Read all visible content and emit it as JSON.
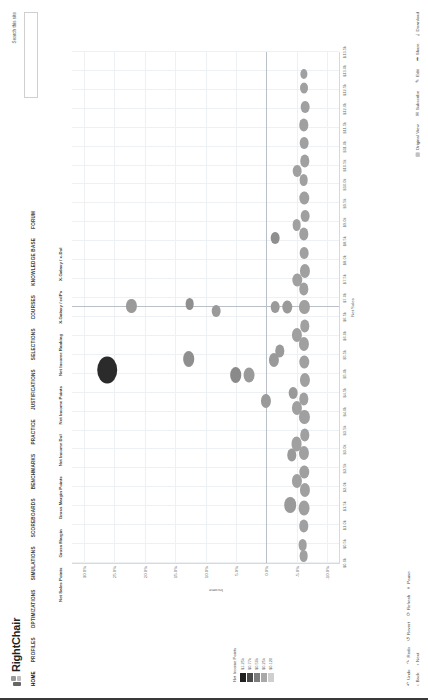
{
  "brand": {
    "name": "RightChair",
    "tagline": ""
  },
  "nav": {
    "items": [
      {
        "label": "HOME",
        "active": true
      },
      {
        "label": "PROFILES",
        "active": false
      },
      {
        "label": "OPTIMIZATIONS",
        "active": false
      },
      {
        "label": "SIMULATIONS",
        "active": false
      },
      {
        "label": "SCOREBOARDS",
        "active": false
      },
      {
        "label": "BENCHMARKS",
        "active": false
      },
      {
        "label": "PRACTICE",
        "active": false
      },
      {
        "label": "JUSTIFICATIONS",
        "active": false
      },
      {
        "label": "SELECTIONS",
        "active": false
      },
      {
        "label": "COURSES",
        "active": false
      },
      {
        "label": "KNOWLEDGE BASE",
        "active": false
      },
      {
        "label": "FORUM",
        "active": false
      }
    ]
  },
  "search": {
    "label": "Search this site",
    "value": "",
    "placeholder": ""
  },
  "columns": [
    "Net Sales Points",
    "Gross Margin",
    "Gross Margin Points",
    "Net Income Dol",
    "Net Income Points",
    "Net Income Ranking",
    "X-Galaxy / edPs",
    "X-Galaxy / x-Dol"
  ],
  "legend": {
    "title": "Net Income Points",
    "stops": [
      {
        "color": "#1f1f1f",
        "value": "$1.25k"
      },
      {
        "color": "#4a4a4a",
        "value": "$0.77k"
      },
      {
        "color": "#7d7d7d",
        "value": "$0.50k"
      },
      {
        "color": "#a8a8a8",
        "value": "$0.25k"
      },
      {
        "color": "#cfcfcf",
        "value": "$0.120"
      }
    ]
  },
  "toolbar_left": [
    {
      "icon": "arrow-left",
      "label": "Back"
    },
    {
      "icon": "arrow-right",
      "label": "Next"
    }
  ],
  "toolbar_left_top": [
    {
      "icon": "undo",
      "label": "Undo"
    },
    {
      "icon": "redo",
      "label": "Redo"
    },
    {
      "icon": "revert",
      "label": "Revert"
    },
    {
      "icon": "refresh",
      "label": "Refresh"
    },
    {
      "icon": "pause",
      "label": "Pause"
    }
  ],
  "toolbar_right": [
    {
      "icon": "layout",
      "label": "Original View"
    },
    {
      "icon": "subscribe",
      "label": "Subscribe"
    },
    {
      "icon": "edit",
      "label": "Edit"
    },
    {
      "icon": "share",
      "label": "Share"
    },
    {
      "icon": "download",
      "label": "Download"
    }
  ],
  "chart_data": {
    "type": "scatter",
    "title": "",
    "xlabel": "Net Sales",
    "ylabel": "Income",
    "xlim": [
      0,
      28
    ],
    "ylim": [
      -0.12,
      0.32
    ],
    "grid": true,
    "legend_position": "left-bottom",
    "xticks": [
      "$0.0k",
      "$0.5k",
      "$1.0k",
      "$1.5k",
      "$2.0k",
      "$2.5k",
      "$3.0k",
      "$3.5k",
      "$4.0k",
      "$4.5k",
      "$5.0k",
      "$5.5k",
      "$6.0k",
      "$6.5k",
      "$7.0k",
      "$7.5k",
      "$8.0k",
      "$8.5k",
      "$9.0k",
      "$9.5k",
      "$10.0k",
      "$10.5k",
      "$11.0k",
      "$11.5k",
      "$12.0k",
      "$12.5k",
      "$13.0k",
      "$13.5k"
    ],
    "yticks": [
      "-10.0%",
      "-5.0%",
      "0.0%",
      "5.0%",
      "10.0%",
      "15.0%",
      "20.0%",
      "25.0%",
      "30.0%"
    ],
    "points": [
      {
        "x": 10.6,
        "y": 0.262,
        "r": 13.5,
        "color": "#2b2b2b"
      },
      {
        "x": 14.1,
        "y": 0.222,
        "r": 7.0,
        "color": "#9a9a9a"
      },
      {
        "x": 11.2,
        "y": 0.128,
        "r": 8.0,
        "color": "#8f8f8f"
      },
      {
        "x": 14.2,
        "y": 0.126,
        "r": 6.0,
        "color": "#8f8f8f"
      },
      {
        "x": 13.8,
        "y": 0.082,
        "r": 6.0,
        "color": "#9a9a9a"
      },
      {
        "x": 10.3,
        "y": 0.05,
        "r": 8.0,
        "color": "#8a8a8a"
      },
      {
        "x": 10.3,
        "y": 0.028,
        "r": 7.5,
        "color": "#9a9a9a"
      },
      {
        "x": 8.9,
        "y": 0.0,
        "r": 7.0,
        "color": "#9a9a9a"
      },
      {
        "x": 11.1,
        "y": -0.013,
        "r": 7.0,
        "color": "#9a9a9a"
      },
      {
        "x": 14.0,
        "y": -0.015,
        "r": 6.0,
        "color": "#9a9a9a"
      },
      {
        "x": 14.0,
        "y": -0.035,
        "r": 6.5,
        "color": "#9a9a9a"
      },
      {
        "x": 17.8,
        "y": -0.015,
        "r": 6.0,
        "color": "#8f8f8f"
      },
      {
        "x": 11.6,
        "y": -0.022,
        "r": 6.5,
        "color": "#9a9a9a"
      },
      {
        "x": 3.2,
        "y": -0.04,
        "r": 8.0,
        "color": "#9a9a9a"
      },
      {
        "x": 5.9,
        "y": -0.042,
        "r": 6.5,
        "color": "#9a9a9a"
      },
      {
        "x": 9.3,
        "y": -0.045,
        "r": 6.0,
        "color": "#9a9a9a"
      },
      {
        "x": 1.0,
        "y": -0.06,
        "r": 6.0,
        "color": "#a0a0a0"
      },
      {
        "x": 2.0,
        "y": -0.062,
        "r": 6.5,
        "color": "#a0a0a0"
      },
      {
        "x": 3.0,
        "y": -0.063,
        "r": 7.5,
        "color": "#a0a0a0"
      },
      {
        "x": 4.0,
        "y": -0.064,
        "r": 7.0,
        "color": "#a0a0a0"
      },
      {
        "x": 5.0,
        "y": -0.063,
        "r": 6.5,
        "color": "#a0a0a0"
      },
      {
        "x": 6.0,
        "y": -0.062,
        "r": 7.0,
        "color": "#a0a0a0"
      },
      {
        "x": 7.0,
        "y": -0.064,
        "r": 6.5,
        "color": "#a0a0a0"
      },
      {
        "x": 8.0,
        "y": -0.063,
        "r": 7.0,
        "color": "#a0a0a0"
      },
      {
        "x": 9.0,
        "y": -0.062,
        "r": 6.5,
        "color": "#a0a0a0"
      },
      {
        "x": 10.0,
        "y": -0.064,
        "r": 7.0,
        "color": "#a0a0a0"
      },
      {
        "x": 11.0,
        "y": -0.063,
        "r": 6.5,
        "color": "#a0a0a0"
      },
      {
        "x": 12.0,
        "y": -0.062,
        "r": 7.0,
        "color": "#a0a0a0"
      },
      {
        "x": 13.0,
        "y": -0.064,
        "r": 6.5,
        "color": "#a0a0a0"
      },
      {
        "x": 14.0,
        "y": -0.063,
        "r": 7.0,
        "color": "#a0a0a0"
      },
      {
        "x": 15.0,
        "y": -0.062,
        "r": 6.5,
        "color": "#a0a0a0"
      },
      {
        "x": 16.0,
        "y": -0.064,
        "r": 7.0,
        "color": "#a0a0a0"
      },
      {
        "x": 17.0,
        "y": -0.063,
        "r": 6.0,
        "color": "#a0a0a0"
      },
      {
        "x": 18.0,
        "y": -0.062,
        "r": 6.5,
        "color": "#a0a0a0"
      },
      {
        "x": 19.0,
        "y": -0.064,
        "r": 6.0,
        "color": "#a0a0a0"
      },
      {
        "x": 20.0,
        "y": -0.063,
        "r": 6.5,
        "color": "#a0a0a0"
      },
      {
        "x": 21.0,
        "y": -0.062,
        "r": 6.0,
        "color": "#a0a0a0"
      },
      {
        "x": 22.0,
        "y": -0.064,
        "r": 6.5,
        "color": "#a0a0a0"
      },
      {
        "x": 23.0,
        "y": -0.063,
        "r": 6.0,
        "color": "#a0a0a0"
      },
      {
        "x": 24.0,
        "y": -0.062,
        "r": 6.5,
        "color": "#a0a0a0"
      },
      {
        "x": 25.0,
        "y": -0.064,
        "r": 6.0,
        "color": "#a0a0a0"
      },
      {
        "x": 26.0,
        "y": -0.063,
        "r": 5.5,
        "color": "#a0a0a0"
      },
      {
        "x": 26.8,
        "y": -0.062,
        "r": 5.0,
        "color": "#a0a0a0"
      },
      {
        "x": 4.5,
        "y": -0.05,
        "r": 7.0,
        "color": "#a0a0a0"
      },
      {
        "x": 6.5,
        "y": -0.05,
        "r": 7.5,
        "color": "#a0a0a0"
      },
      {
        "x": 8.5,
        "y": -0.051,
        "r": 7.0,
        "color": "#a0a0a0"
      },
      {
        "x": 12.5,
        "y": -0.05,
        "r": 7.0,
        "color": "#a0a0a0"
      },
      {
        "x": 15.5,
        "y": -0.051,
        "r": 6.5,
        "color": "#a0a0a0"
      },
      {
        "x": 18.5,
        "y": -0.05,
        "r": 6.0,
        "color": "#a0a0a0"
      },
      {
        "x": 21.5,
        "y": -0.051,
        "r": 6.0,
        "color": "#a0a0a0"
      },
      {
        "x": 0.4,
        "y": -0.062,
        "r": 6.0,
        "color": "#a0a0a0"
      }
    ]
  }
}
